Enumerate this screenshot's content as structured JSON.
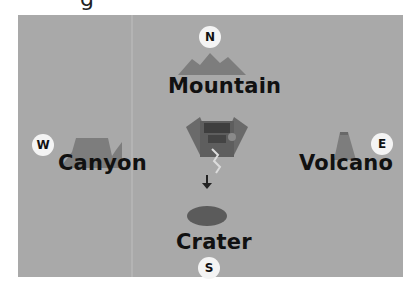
{
  "title_fragment": "g",
  "map": {
    "background_color": "#a9a9a9",
    "compass": {
      "north": "N",
      "south": "S",
      "east": "E",
      "west": "W"
    },
    "landmarks": {
      "north": {
        "label": "Mountain",
        "icon": "mountain-icon"
      },
      "south": {
        "label": "Crater",
        "icon": "crater-icon"
      },
      "east": {
        "label": "Volcano",
        "icon": "volcano-icon"
      },
      "west": {
        "label": "Canyon",
        "icon": "canyon-icon"
      }
    },
    "center": {
      "icon": "rover-lander-icon",
      "direction_arrow": "down-arrow-icon"
    }
  }
}
